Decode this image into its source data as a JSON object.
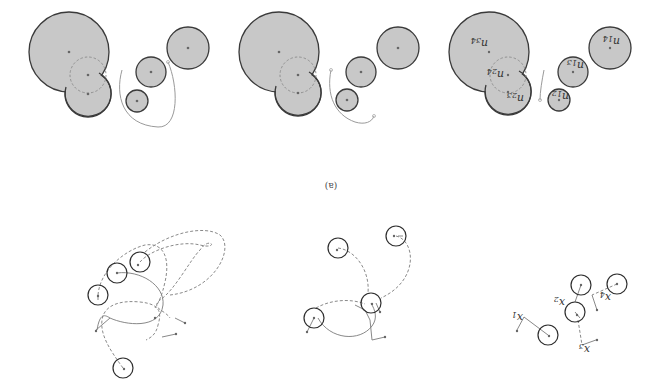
{
  "figure": {
    "orientation": "rotated-180",
    "caption": "(a)",
    "top_row": {
      "panels": [
        {
          "name": "panel-1",
          "large_disk": {
            "cx": 69,
            "cy": 52,
            "r": 40
          },
          "merged_disk": {
            "cx": 88,
            "cy": 94,
            "r": 23
          },
          "dashed_circle": {
            "cx": 88,
            "cy": 75,
            "r": 18
          },
          "small_disks": [
            {
              "cx": 188,
              "cy": 48,
              "r": 21
            },
            {
              "cx": 151,
              "cy": 72,
              "r": 15
            },
            {
              "cx": 137,
              "cy": 101,
              "r": 11
            }
          ]
        },
        {
          "name": "panel-2",
          "large_disk": {
            "cx": 279,
            "cy": 52,
            "r": 40
          },
          "merged_disk": {
            "cx": 298,
            "cy": 93,
            "r": 23
          },
          "dashed_circle": {
            "cx": 298,
            "cy": 75,
            "r": 18
          },
          "small_disks": [
            {
              "cx": 398,
              "cy": 48,
              "r": 21
            },
            {
              "cx": 361,
              "cy": 72,
              "r": 15
            },
            {
              "cx": 347,
              "cy": 100,
              "r": 11
            }
          ]
        },
        {
          "name": "panel-3",
          "large_disk": {
            "cx": 489,
            "cy": 52,
            "r": 40
          },
          "merged_disk": {
            "cx": 508,
            "cy": 92,
            "r": 23
          },
          "dashed_circle": {
            "cx": 508,
            "cy": 75,
            "r": 18
          },
          "small_disks": [
            {
              "cx": 610,
              "cy": 48,
              "r": 21
            },
            {
              "cx": 573,
              "cy": 72,
              "r": 15
            },
            {
              "cx": 559,
              "cy": 100,
              "r": 11
            }
          ],
          "labels": [
            {
              "base": "n",
              "sub": "34",
              "x": 489,
              "y": 44
            },
            {
              "base": "n",
              "sub": "24",
              "x": 489,
              "y": 75
            },
            {
              "base": "n",
              "sub": "23",
              "x": 509,
              "y": 99
            },
            {
              "base": "n",
              "sub": "13",
              "x": 573,
              "y": 64
            },
            {
              "base": "n",
              "sub": "12",
              "x": 557,
              "y": 97
            },
            {
              "base": "n",
              "sub": "14",
              "x": 609,
              "y": 40
            }
          ]
        }
      ]
    },
    "bottom_row": {
      "panels": [
        {
          "name": "trajectory-panel-1",
          "agents": [
            {
              "cx": 140,
              "cy": 262,
              "r": 10
            },
            {
              "cx": 117,
              "cy": 273,
              "r": 10
            },
            {
              "cx": 98,
              "cy": 295,
              "r": 10
            },
            {
              "cx": 123,
              "cy": 368,
              "r": 10
            }
          ]
        },
        {
          "name": "trajectory-panel-2",
          "agents": [
            {
              "cx": 338,
              "cy": 248,
              "r": 10
            },
            {
              "cx": 396,
              "cy": 236,
              "r": 10
            },
            {
              "cx": 371,
              "cy": 303,
              "r": 10
            },
            {
              "cx": 314,
              "cy": 318,
              "r": 10
            }
          ]
        },
        {
          "name": "trajectory-panel-3",
          "agents": [
            {
              "cx": 548,
              "cy": 335,
              "r": 10
            },
            {
              "cx": 575,
              "cy": 312,
              "r": 10
            },
            {
              "cx": 581,
              "cy": 285,
              "r": 10
            },
            {
              "cx": 617,
              "cy": 284,
              "r": 10
            }
          ],
          "labels": [
            {
              "base": "x",
              "sub": "1",
              "x": 516,
              "y": 318
            },
            {
              "base": "x",
              "sub": "2",
              "x": 558,
              "y": 303
            },
            {
              "base": "x",
              "sub": "3",
              "x": 583,
              "y": 350
            },
            {
              "base": "x",
              "sub": "4",
              "x": 604,
              "y": 298
            }
          ]
        }
      ]
    }
  }
}
